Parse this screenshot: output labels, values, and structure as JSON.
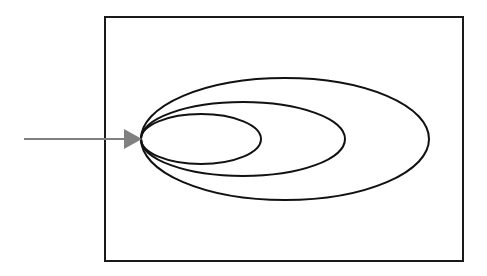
{
  "diagram": {
    "type": "nested-ellipses",
    "colors": {
      "background": "#ffffff",
      "frame_stroke": "#1a1a1a",
      "ellipse_stroke": "#111111",
      "arrow": "#808080"
    },
    "frame": {
      "x": 105,
      "y": 17,
      "width": 358,
      "height": 244
    },
    "ellipses": [
      {
        "name": "outer",
        "cx": 285,
        "cy": 139,
        "rx": 144,
        "ry": 61
      },
      {
        "name": "middle",
        "cx": 243,
        "cy": 139,
        "rx": 102,
        "ry": 37
      },
      {
        "name": "inner",
        "cx": 201,
        "cy": 139,
        "rx": 60,
        "ry": 25
      }
    ],
    "arrow": {
      "x1": 24,
      "y1": 139,
      "x2": 126,
      "y2": 139,
      "head_tip_x": 142
    }
  }
}
